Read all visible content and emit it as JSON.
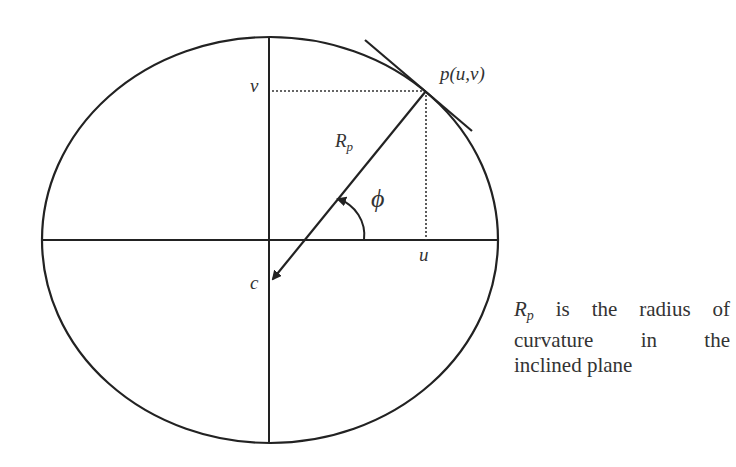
{
  "figure": {
    "type": "ellipse-radius-of-curvature",
    "labels": {
      "point": "p(u,v)",
      "v_axis_label": "v",
      "u_axis_label": "u",
      "center_label": "c",
      "radius_main": "R",
      "radius_sub": "p",
      "angle": "ϕ"
    },
    "caption": {
      "symbol_main": "R",
      "symbol_sub": "p",
      "line1_rest": " is the radius of",
      "line2": "curvature in the",
      "line3": "inclined plane"
    },
    "colors": {
      "stroke": "#222222",
      "background": "#ffffff"
    }
  }
}
